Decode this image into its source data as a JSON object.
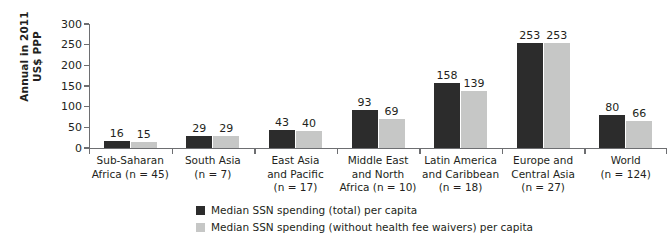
{
  "chart_data": {
    "type": "bar",
    "title": "",
    "xlabel": "",
    "ylabel": "Annual in 2011\nUS$ PPP",
    "ylim": [
      0,
      300
    ],
    "yticks": [
      0,
      50,
      100,
      150,
      200,
      250,
      300
    ],
    "ytick_labels": [
      "0",
      "50",
      "100",
      "150",
      "200",
      "250",
      "300"
    ],
    "grid": false,
    "legend_position": "bottom",
    "categories": [
      "Sub-Saharan\nAfrica (n = 45)",
      "South Asia\n(n = 7)",
      "East Asia\nand Pacific\n(n = 17)",
      "Middle East\nand North\nAfrica (n = 10)",
      "Latin America\nand Caribbean\n(n = 18)",
      "Europe and\nCentral Asia\n(n = 27)",
      "World\n(n = 124)"
    ],
    "series": [
      {
        "name": "Median SSN spending (total) per capita",
        "color": "#2c2c2c",
        "values": [
          16,
          29,
          43,
          93,
          158,
          253,
          80
        ],
        "value_labels": [
          "16",
          "29",
          "43",
          "93",
          "158",
          "253",
          "80"
        ]
      },
      {
        "name": "Median SSN spending (without health fee waivers) per capita",
        "color": "#c6c7c6",
        "values": [
          15,
          29,
          40,
          69,
          139,
          253,
          66
        ],
        "value_labels": [
          "15",
          "29",
          "40",
          "69",
          "139",
          "253",
          "66"
        ]
      }
    ]
  },
  "legend": {
    "items": [
      {
        "label": "Median SSN spending (total) per capita",
        "swatch": "dark"
      },
      {
        "label": "Median SSN spending (without health fee waivers) per capita",
        "swatch": "light"
      }
    ]
  }
}
